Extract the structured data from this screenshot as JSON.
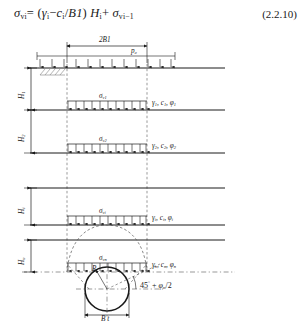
{
  "equation": {
    "text": "σvi = (γi − ci/B1) Hi + σv(i−1)",
    "lhs_sym": "σ",
    "lhs_sub": "vi",
    "eq": "=",
    "open": "(",
    "gamma": "γ",
    "gamma_sub": "i",
    "minus": "−",
    "c": "c",
    "c_sub": "i",
    "slash": "/",
    "B1": "B1",
    "close": ")",
    "H": "H",
    "H_sub": "i",
    "plus": "+",
    "rhs_sym": "σ",
    "rhs_sub": "vi−1",
    "number": "(2.2.10)"
  },
  "diagram": {
    "top_dimension": "2B1",
    "surcharge_label": "p₀",
    "bottom_dimension": "B t",
    "angle_label": "45° + φₙ/2",
    "angle_value": "45",
    "angle_deg": "°",
    "angle_plus": "+",
    "angle_phi": "φ",
    "angle_phi_sub": "n",
    "angle_div": "/2",
    "radius_label": "R",
    "depths": [
      {
        "name": "H1",
        "sym": "H",
        "sub": "1"
      },
      {
        "name": "H2",
        "sym": "H",
        "sub": "2"
      },
      {
        "name": "Hi",
        "sym": "H",
        "sub": "i"
      },
      {
        "name": "Hn",
        "sym": "H",
        "sub": "n"
      }
    ],
    "stresses": [
      {
        "name": "sigma_v1",
        "sym": "σ",
        "sub": "v1"
      },
      {
        "name": "sigma_v2",
        "sym": "σ",
        "sub": "v2"
      },
      {
        "name": "sigma_vi",
        "sym": "σ",
        "sub": "vi"
      },
      {
        "name": "sigma_vn",
        "sym": "σ",
        "sub": "vn"
      }
    ],
    "soil_params": [
      {
        "gamma": "γ",
        "g_sub": "1",
        "c": "c",
        "c_sub": "1",
        "phi": "φ",
        "p_sub": "1",
        "text": "γ₁, c₁, φ₁"
      },
      {
        "gamma": "γ",
        "g_sub": "2",
        "c": "c",
        "c_sub": "2",
        "phi": "φ",
        "p_sub": "2",
        "text": "γ₂, c₂, φ₂"
      },
      {
        "gamma": "γ",
        "g_sub": "i",
        "c": "c",
        "c_sub": "i",
        "phi": "φ",
        "p_sub": "i",
        "text": "γᵢ, cᵢ, φᵢ"
      },
      {
        "gamma": "γ",
        "g_sub": "n",
        "c": "c",
        "c_sub": "n",
        "phi": "φ",
        "p_sub": "n",
        "text": "γₙ, cₙ, φₙ"
      }
    ]
  },
  "colors": {
    "line": "#1a1a1a",
    "dashed": "#555555",
    "text": "#1a1a1a"
  }
}
